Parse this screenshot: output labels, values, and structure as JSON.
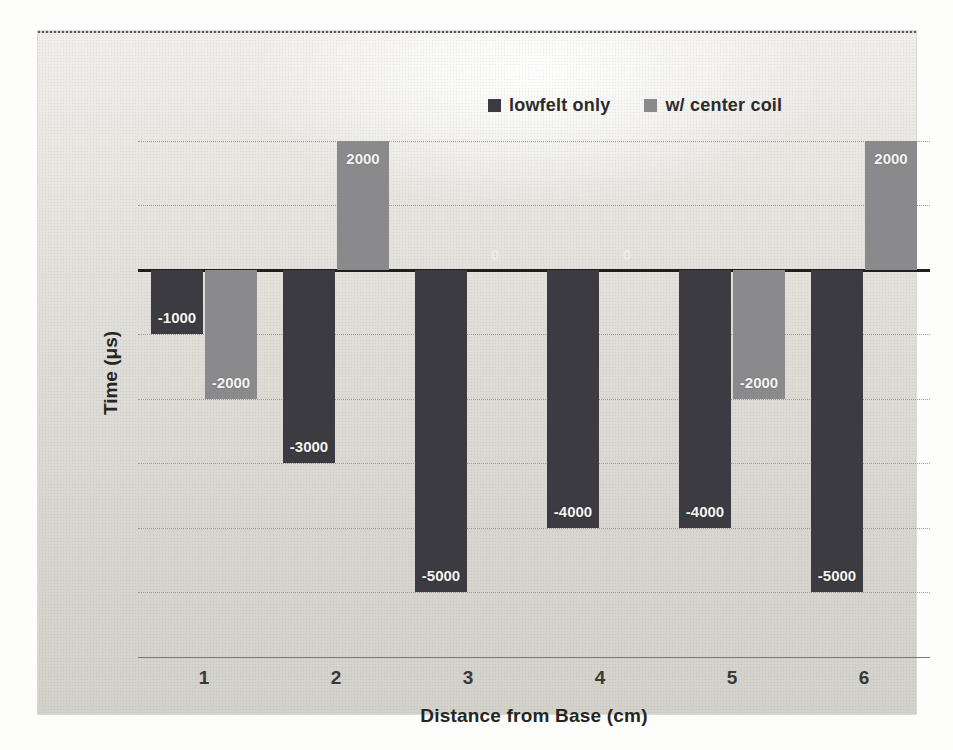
{
  "chart_data": {
    "type": "bar",
    "title": "",
    "xlabel": "Distance from Base (cm)",
    "ylabel": "Time (μs)",
    "categories": [
      "1",
      "2",
      "3",
      "4",
      "5",
      "6"
    ],
    "series": [
      {
        "name": "lowfelt only",
        "color": "#3b3b41",
        "values": [
          -1000,
          -3000,
          -5000,
          -4000,
          -4000,
          -5000
        ]
      },
      {
        "name": "w/ center coil",
        "color": "#8a8a8c",
        "values": [
          -2000,
          2000,
          0,
          0,
          -2000,
          2000
        ]
      }
    ],
    "data_labels": {
      "series1": [
        "-1000",
        "-3000",
        "-5000",
        "-4000",
        "-4000",
        "-5000"
      ],
      "series2": [
        "-2000",
        "2000",
        "0",
        "0",
        "-2000",
        "2000"
      ]
    },
    "ylim": [
      -6000,
      3000
    ],
    "grid_interval": 1000,
    "grid": true,
    "legend_position": "top",
    "colors": {
      "grid": "#9d9c94",
      "zero_axis": "#1f1f1d",
      "label_text": "#f4f4f1"
    }
  }
}
